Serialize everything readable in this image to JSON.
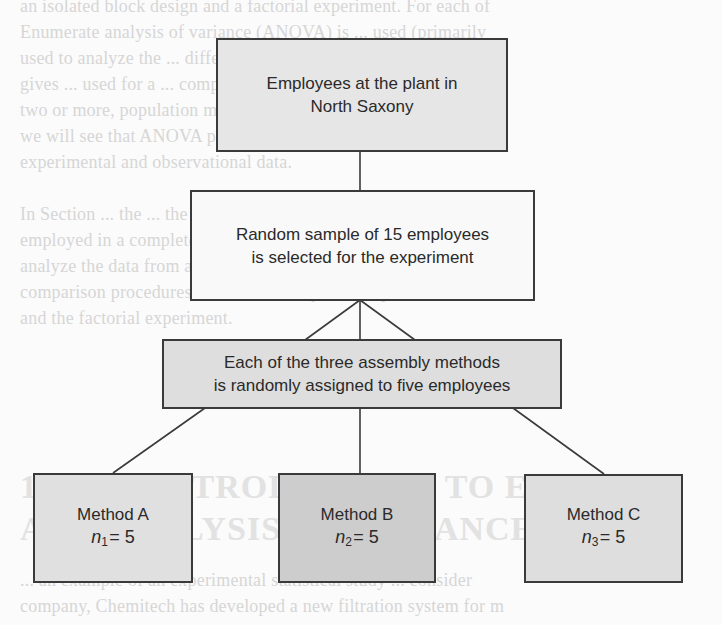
{
  "diagram": {
    "colors": {
      "line": "#3a3a3a",
      "population_fill": "#e6e6e6",
      "sample_fill": "#f9f9f9",
      "assignment_fill": "#dedede",
      "method_a_fill": "#e0e0e0",
      "method_b_fill": "#cdcdcd",
      "method_c_fill": "#dedede"
    },
    "nodes": {
      "population": {
        "line1": "Employees at the plant in",
        "line2": "North Saxony"
      },
      "sample": {
        "line1": "Random sample of 15 employees",
        "line2": "is selected for the experiment"
      },
      "assignment": {
        "line1": "Each of the three assembly methods",
        "line2": "is randomly assigned to five employees"
      },
      "methods": [
        {
          "label": "Method A",
          "n_symbol": "n",
          "n_sub": "1",
          "n_eq": "= 5"
        },
        {
          "label": "Method B",
          "n_symbol": "n",
          "n_sub": "2",
          "n_eq": "= 5"
        },
        {
          "label": "Method C",
          "n_symbol": "n",
          "n_sub": "3",
          "n_eq": "= 5"
        }
      ]
    }
  },
  "background_bleed": {
    "lines": [
      "an isolated block design and a factorial experiment. For each of",
      "Enumerate analysis of variance (ANOVA) is ... used (primarily",
      "used to analyze the ... differences in ... means of ... several",
      "gives ... used for a ... completely randomized experimental design",
      "two or more, population means ... are obtained ... through",
      "we will see that ANOVA plays a key role in analyzing the re",
      "experimental and observational data.",
      "In Section ... the ... the ... principles of an exp",
      "employed in a completely randomized design. In section 13.2, w",
      "analyze the data from a completely randomized experimental de",
      "comparison procedures and other widely used experimental",
      "and the factorial experiment."
    ],
    "heading_lines": [
      "13.1 AN INTRODUCTION TO EXPERI",
      "AND ANALYSIS OF VARIANCE"
    ],
    "footer_lines": [
      "... an example of an experimental statistical study ... consider",
      "company, Chemitech has developed a new filtration system for m"
    ]
  }
}
